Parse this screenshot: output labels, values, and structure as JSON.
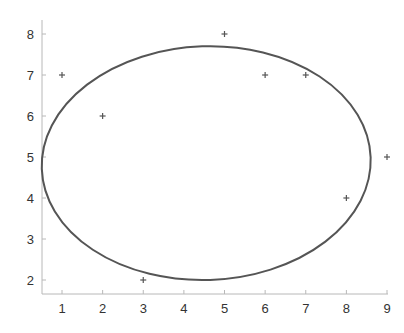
{
  "chart_data": {
    "type": "scatter",
    "title": "",
    "xlabel": "",
    "ylabel": "",
    "xlim": [
      0.5,
      9
    ],
    "ylim": [
      1.65,
      8.35
    ],
    "x_ticks": [
      1,
      2,
      3,
      4,
      5,
      6,
      7,
      8,
      9
    ],
    "y_ticks": [
      2,
      3,
      4,
      5,
      6,
      7,
      8
    ],
    "grid": false,
    "legend": null,
    "marker": "+",
    "points": [
      {
        "x": 1,
        "y": 7
      },
      {
        "x": 2,
        "y": 6
      },
      {
        "x": 3,
        "y": 2
      },
      {
        "x": 5,
        "y": 8
      },
      {
        "x": 6,
        "y": 7
      },
      {
        "x": 7,
        "y": 7
      },
      {
        "x": 8,
        "y": 4
      },
      {
        "x": 9,
        "y": 5
      }
    ],
    "annotations": [
      {
        "type": "ellipse",
        "description": "fitted/bounding ellipse",
        "center": [
          4.55,
          4.85
        ],
        "semi_axis_x": 4.05,
        "semi_axis_y": 2.85,
        "rotation_deg": -2
      }
    ],
    "colors": {
      "points": "#555555",
      "ellipse": "#555555",
      "axis": "#b8b8b8",
      "text": "#333333"
    }
  }
}
